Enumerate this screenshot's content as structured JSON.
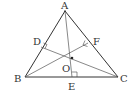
{
  "diagram": {
    "points": {
      "A": {
        "label": "A",
        "x": 65,
        "y": 11
      },
      "B": {
        "label": "B",
        "x": 25,
        "y": 77
      },
      "C": {
        "label": "C",
        "x": 118,
        "y": 77
      },
      "D": {
        "label": "D",
        "x": 41,
        "y": 47
      },
      "E": {
        "label": "E",
        "x": 72,
        "y": 77
      },
      "F": {
        "label": "F",
        "x": 88,
        "y": 43
      },
      "O": {
        "label": "O",
        "x": 72,
        "y": 58
      }
    },
    "segments": [
      [
        "A",
        "B"
      ],
      [
        "B",
        "C"
      ],
      [
        "C",
        "A"
      ],
      [
        "A",
        "E"
      ],
      [
        "B",
        "F"
      ],
      [
        "C",
        "D"
      ]
    ],
    "right_angles": [
      "D",
      "E",
      "F"
    ]
  }
}
